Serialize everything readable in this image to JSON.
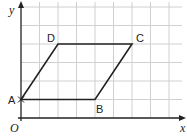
{
  "diagram": {
    "type": "coordinate-grid-parallelogram",
    "axes": {
      "x_label": "x",
      "y_label": "y",
      "origin_label": "O"
    },
    "grid": {
      "cols": 9,
      "rows": 6,
      "cell_px": 18.5,
      "origin_px": [
        21,
        118
      ],
      "line_color": "#d0d0d0",
      "axis_color": "#222222"
    },
    "shape": {
      "name": "parallelogram ABCD",
      "stroke_color": "#222222",
      "vertices": [
        {
          "label": "A",
          "x": 0,
          "y": 1
        },
        {
          "label": "B",
          "x": 4,
          "y": 1
        },
        {
          "label": "C",
          "x": 6,
          "y": 4
        },
        {
          "label": "D",
          "x": 2,
          "y": 4
        }
      ]
    }
  }
}
